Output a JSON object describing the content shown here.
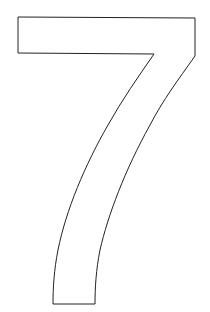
{
  "figure": {
    "glyph": "7",
    "stroke_color": "#222222",
    "fill_color": "#ffffff",
    "background": "#ffffff"
  }
}
